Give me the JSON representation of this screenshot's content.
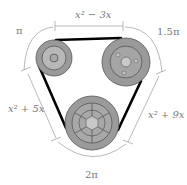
{
  "diagram": {
    "type": "pulley-belt-system",
    "labels": {
      "top_length": "x² − 3x",
      "left_length": "x² + 5x",
      "right_length": "x² + 9x",
      "arc_top_left": "π",
      "arc_top_right": "1.5π",
      "arc_bottom": "2π"
    },
    "pulleys": [
      {
        "name": "top-left-pulley",
        "cx": 54,
        "cy": 58,
        "r": 18
      },
      {
        "name": "top-right-pulley",
        "cx": 126,
        "cy": 62,
        "r": 24
      },
      {
        "name": "bottom-pulley",
        "cx": 92,
        "cy": 123,
        "r": 27
      }
    ],
    "colors": {
      "pulley_fill": "#9a9a9a",
      "pulley_inner": "#b5b5b5",
      "hub": "#c8c8c8",
      "belt": "#000000",
      "dimension": "#888888"
    }
  }
}
